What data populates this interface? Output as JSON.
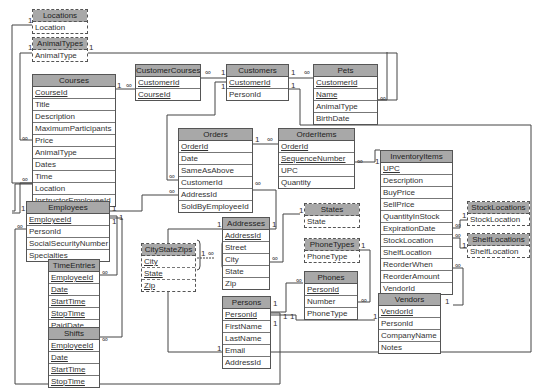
{
  "diagram": {
    "type": "relational-database-schema",
    "tables": [
      {
        "id": "locations",
        "name": "Locations",
        "lookup": true,
        "fields": [
          {
            "name": "Location",
            "key": false
          }
        ]
      },
      {
        "id": "animaltypes",
        "name": "AnimalTypes",
        "lookup": true,
        "fields": [
          {
            "name": "AnimalType",
            "key": false
          }
        ]
      },
      {
        "id": "courses",
        "name": "Courses",
        "lookup": false,
        "fields": [
          {
            "name": "CourseId",
            "key": true
          },
          {
            "name": "Title",
            "key": false
          },
          {
            "name": "Description",
            "key": false
          },
          {
            "name": "MaximumParticipants",
            "key": false
          },
          {
            "name": "Price",
            "key": false
          },
          {
            "name": "AnimalType",
            "key": false
          },
          {
            "name": "Dates",
            "key": false
          },
          {
            "name": "Time",
            "key": false
          },
          {
            "name": "Location",
            "key": false
          },
          {
            "name": "InstructorEmployeeId",
            "key": false
          }
        ]
      },
      {
        "id": "customercourses",
        "name": "CustomerCourses",
        "lookup": false,
        "fields": [
          {
            "name": "CustomerId",
            "key": true
          },
          {
            "name": "CourseId",
            "key": true
          }
        ]
      },
      {
        "id": "customers",
        "name": "Customers",
        "lookup": false,
        "fields": [
          {
            "name": "CustomerId",
            "key": true
          },
          {
            "name": "PersonId",
            "key": false
          }
        ]
      },
      {
        "id": "pets",
        "name": "Pets",
        "lookup": false,
        "fields": [
          {
            "name": "CustomerId",
            "key": true
          },
          {
            "name": "Name",
            "key": true
          },
          {
            "name": "AnimalType",
            "key": false
          },
          {
            "name": "BirthDate",
            "key": false
          }
        ]
      },
      {
        "id": "orders",
        "name": "Orders",
        "lookup": false,
        "fields": [
          {
            "name": "OrderId",
            "key": true
          },
          {
            "name": "Date",
            "key": false
          },
          {
            "name": "SameAsAbove",
            "key": false
          },
          {
            "name": "CustomerId",
            "key": false
          },
          {
            "name": "AddressId",
            "key": false
          },
          {
            "name": "SoldByEmployeeId",
            "key": false
          }
        ]
      },
      {
        "id": "orderitems",
        "name": "OrderItems",
        "lookup": false,
        "fields": [
          {
            "name": "OrderId",
            "key": true
          },
          {
            "name": "SequenceNumber",
            "key": true
          },
          {
            "name": "UPC",
            "key": false
          },
          {
            "name": "Quantity",
            "key": false
          }
        ]
      },
      {
        "id": "inventoryitems",
        "name": "InventoryItems",
        "lookup": false,
        "fields": [
          {
            "name": "UPC",
            "key": true
          },
          {
            "name": "Description",
            "key": false
          },
          {
            "name": "BuyPrice",
            "key": false
          },
          {
            "name": "SellPrice",
            "key": false
          },
          {
            "name": "QuantityInStock",
            "key": false
          },
          {
            "name": "ExpirationDate",
            "key": false
          },
          {
            "name": "StockLocation",
            "key": false
          },
          {
            "name": "ShelfLocation",
            "key": false
          },
          {
            "name": "ReorderWhen",
            "key": false
          },
          {
            "name": "ReorderAmount",
            "key": false
          },
          {
            "name": "VendorId",
            "key": false
          }
        ]
      },
      {
        "id": "stocklocations",
        "name": "StockLocations",
        "lookup": true,
        "fields": [
          {
            "name": "StockLocation",
            "key": false
          }
        ]
      },
      {
        "id": "shelflocations",
        "name": "ShelfLocations",
        "lookup": true,
        "fields": [
          {
            "name": "ShelfLocation",
            "key": false
          }
        ]
      },
      {
        "id": "employees",
        "name": "Employees",
        "lookup": false,
        "fields": [
          {
            "name": "EmployeeId",
            "key": true
          },
          {
            "name": "PersonId",
            "key": false
          },
          {
            "name": "SocialSecurityNumber",
            "key": false
          },
          {
            "name": "Specialties",
            "key": false
          }
        ]
      },
      {
        "id": "timeentries",
        "name": "TimeEntries",
        "lookup": false,
        "fields": [
          {
            "name": "EmployeeId",
            "key": true
          },
          {
            "name": "Date",
            "key": true
          },
          {
            "name": "StartTime",
            "key": true
          },
          {
            "name": "StopTime",
            "key": true
          },
          {
            "name": "PaidDate",
            "key": false
          }
        ]
      },
      {
        "id": "shifts",
        "name": "Shifts",
        "lookup": false,
        "fields": [
          {
            "name": "EmployeeId",
            "key": true
          },
          {
            "name": "Date",
            "key": true
          },
          {
            "name": "StartTime",
            "key": true
          },
          {
            "name": "StopTime",
            "key": true
          }
        ]
      },
      {
        "id": "addresses",
        "name": "Addresses",
        "lookup": false,
        "fields": [
          {
            "name": "AddressId",
            "key": true
          },
          {
            "name": "Street",
            "key": false
          },
          {
            "name": "City",
            "key": false
          },
          {
            "name": "State",
            "key": false
          },
          {
            "name": "Zip",
            "key": false
          }
        ]
      },
      {
        "id": "citystatezips",
        "name": "CityStateZips",
        "lookup": true,
        "fields": [
          {
            "name": "City",
            "key": true
          },
          {
            "name": "State",
            "key": true
          },
          {
            "name": "Zip",
            "key": true
          }
        ]
      },
      {
        "id": "states",
        "name": "States",
        "lookup": true,
        "fields": [
          {
            "name": "State",
            "key": false
          }
        ]
      },
      {
        "id": "phonetypes",
        "name": "PhoneTypes",
        "lookup": true,
        "fields": [
          {
            "name": "PhoneType",
            "key": false
          }
        ]
      },
      {
        "id": "phones",
        "name": "Phones",
        "lookup": false,
        "fields": [
          {
            "name": "PersonId",
            "key": true
          },
          {
            "name": "Number",
            "key": false
          },
          {
            "name": "PhoneType",
            "key": false
          }
        ]
      },
      {
        "id": "persons",
        "name": "Persons",
        "lookup": false,
        "fields": [
          {
            "name": "PersonId",
            "key": true
          },
          {
            "name": "FirstName",
            "key": false
          },
          {
            "name": "LastName",
            "key": false
          },
          {
            "name": "Email",
            "key": false
          },
          {
            "name": "AddressId",
            "key": false
          }
        ]
      },
      {
        "id": "vendors",
        "name": "Vendors",
        "lookup": false,
        "fields": [
          {
            "name": "VendorId",
            "key": true
          },
          {
            "name": "PersonId",
            "key": false
          },
          {
            "name": "CompanyName",
            "key": false
          },
          {
            "name": "Notes",
            "key": false
          }
        ]
      }
    ],
    "relationships": [
      {
        "from": "Locations.Location",
        "to": "Courses.Location",
        "one": "1",
        "many": "∞"
      },
      {
        "from": "AnimalTypes.AnimalType",
        "to": "Courses.AnimalType",
        "one": "1",
        "many": "∞"
      },
      {
        "from": "AnimalTypes.AnimalType",
        "to": "Pets.AnimalType",
        "one": "1",
        "many": "∞"
      },
      {
        "from": "Courses.CourseId",
        "to": "CustomerCourses.CourseId",
        "one": "1",
        "many": "∞"
      },
      {
        "from": "Customers.CustomerId",
        "to": "CustomerCourses.CustomerId",
        "one": "1",
        "many": "∞"
      },
      {
        "from": "Customers.CustomerId",
        "to": "Pets.CustomerId",
        "one": "1",
        "many": "∞"
      },
      {
        "from": "Customers.CustomerId",
        "to": "Orders.CustomerId",
        "one": "1",
        "many": "∞"
      },
      {
        "from": "Persons.PersonId",
        "to": "Customers.PersonId",
        "one": "1",
        "many": "1"
      },
      {
        "from": "Orders.OrderId",
        "to": "OrderItems.OrderId",
        "one": "1",
        "many": "∞"
      },
      {
        "from": "InventoryItems.UPC",
        "to": "OrderItems.UPC",
        "one": "1",
        "many": "∞"
      },
      {
        "from": "StockLocations.StockLocation",
        "to": "InventoryItems.StockLocation",
        "one": "1",
        "many": "∞"
      },
      {
        "from": "ShelfLocations.ShelfLocation",
        "to": "InventoryItems.ShelfLocation",
        "one": "1",
        "many": "∞"
      },
      {
        "from": "Vendors.VendorId",
        "to": "InventoryItems.VendorId",
        "one": "1",
        "many": "∞"
      },
      {
        "from": "Employees.EmployeeId",
        "to": "Courses.InstructorEmployeeId",
        "one": "1",
        "many": "∞"
      },
      {
        "from": "Employees.EmployeeId",
        "to": "Orders.SoldByEmployeeId",
        "one": "1",
        "many": "∞"
      },
      {
        "from": "Employees.EmployeeId",
        "to": "TimeEntries.EmployeeId",
        "one": "1",
        "many": "∞"
      },
      {
        "from": "Employees.EmployeeId",
        "to": "Shifts.EmployeeId",
        "one": "1",
        "many": "∞"
      },
      {
        "from": "Persons.PersonId",
        "to": "Employees.PersonId",
        "one": "1",
        "many": "∞"
      },
      {
        "from": "Addresses.AddressId",
        "to": "Orders.AddressId",
        "one": "1",
        "many": "∞"
      },
      {
        "from": "Addresses.AddressId",
        "to": "Persons.AddressId",
        "one": "1",
        "many": "1"
      },
      {
        "from": "CityStateZips.City/State/Zip",
        "to": "Addresses.City/State/Zip",
        "one": "1",
        "many": "∞"
      },
      {
        "from": "States.State",
        "to": "Addresses.State",
        "one": "1",
        "many": "∞"
      },
      {
        "from": "PhoneTypes.PhoneType",
        "to": "Phones.PhoneType",
        "one": "1",
        "many": "∞"
      },
      {
        "from": "Persons.PersonId",
        "to": "Phones.PersonId",
        "one": "1",
        "many": "∞"
      },
      {
        "from": "Persons.PersonId",
        "to": "Vendors.PersonId",
        "one": "1",
        "many": "1"
      }
    ]
  },
  "cardinality": {
    "one": "1",
    "many": "∞"
  }
}
